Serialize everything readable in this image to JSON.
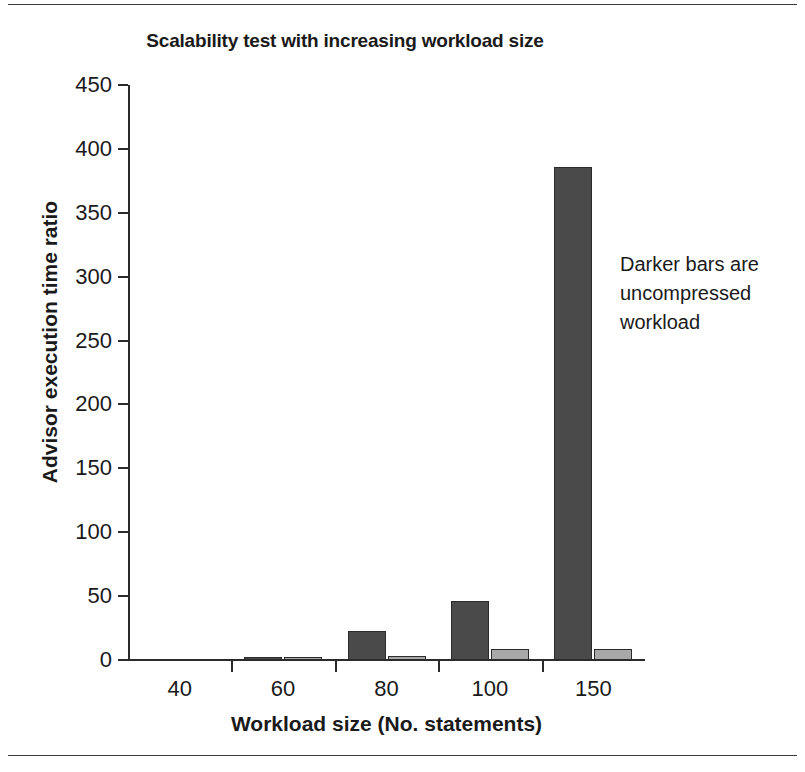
{
  "figure": {
    "top_rule": "",
    "bottom_rule": ""
  },
  "annotation": {
    "line1": "Darker bars are",
    "line2": "uncompressed",
    "line3": "workload"
  },
  "colors": {
    "dark_bar": "#4a4a4a",
    "light_bar": "#a8a8a8",
    "axis": "#2b2b2b",
    "text": "#1a1a1a",
    "background": "#ffffff"
  },
  "chart_data": {
    "type": "bar",
    "title": "Scalability test with increasing workload size",
    "xlabel": "Workload size (No. statements)",
    "ylabel": "Advisor execution time ratio",
    "categories": [
      "40",
      "60",
      "80",
      "100",
      "150"
    ],
    "series": [
      {
        "name": "uncompressed workload",
        "color": "#4a4a4a",
        "values": [
          0,
          2,
          23,
          46,
          386
        ]
      },
      {
        "name": "compressed workload",
        "color": "#a8a8a8",
        "values": [
          0,
          2,
          3,
          9,
          9
        ]
      }
    ],
    "ylim": [
      0,
      450
    ],
    "yticks": [
      0,
      50,
      100,
      150,
      200,
      250,
      300,
      350,
      400,
      450
    ],
    "ytick_labels": [
      "0",
      "50",
      "100",
      "150",
      "200",
      "250",
      "300",
      "350",
      "400",
      "450"
    ],
    "grid": false,
    "legend": "none",
    "annotations": [
      "Darker bars are uncompressed workload"
    ]
  }
}
